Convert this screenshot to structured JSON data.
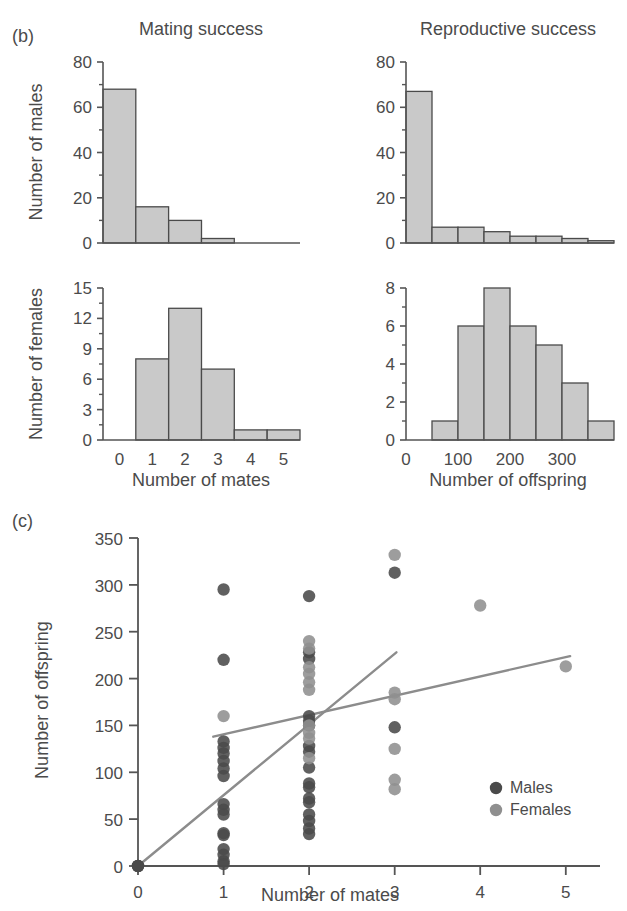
{
  "figure": {
    "panel_b_id": "(b)",
    "panel_c_id": "(c)",
    "top_clipped_text": "",
    "colors": {
      "bar_fill": "#c9c9c9",
      "bar_stroke": "#4a4a4a",
      "axis": "#555555",
      "male_dot": "#4a4a4a",
      "female_dot": "#8f8f8f",
      "regression_line": "#8c8c8c",
      "text": "#4b4b4b"
    }
  },
  "panel_b": {
    "titles": {
      "left": "Mating success",
      "right": "Reproductive success"
    },
    "axis_labels": {
      "males_y": "Number of males",
      "females_y": "Number of females",
      "mates_x": "Number of mates",
      "offspring_x": "Number of offspring"
    }
  },
  "panel_c": {
    "xlabel": "Number of mates",
    "ylabel": "Number of offspring",
    "legend": [
      {
        "label": "Males",
        "color": "#4a4a4a"
      },
      {
        "label": "Females",
        "color": "#8f8f8f"
      }
    ]
  },
  "chart_data": [
    {
      "type": "bar",
      "id": "males-mating-success",
      "title": "Mating success",
      "xlabel": "Number of mates",
      "ylabel": "Number of males",
      "categories": [
        "0",
        "1",
        "2",
        "3",
        "4",
        "5"
      ],
      "values": [
        68,
        16,
        10,
        2,
        0,
        0
      ],
      "xticks": [
        0,
        1,
        2,
        3,
        4,
        5
      ],
      "yticks": [
        0,
        20,
        40,
        60,
        80
      ],
      "ylim": [
        0,
        80
      ],
      "xlim": [
        0,
        6
      ],
      "grid": false,
      "legend": "none"
    },
    {
      "type": "bar",
      "id": "males-reproductive-success",
      "title": "Reproductive success",
      "xlabel": "Number of offspring",
      "ylabel": "Number of males",
      "bin_edges": [
        0,
        50,
        100,
        150,
        200,
        250,
        300,
        350,
        400
      ],
      "values": [
        67,
        7,
        7,
        5,
        3,
        3,
        2,
        1
      ],
      "xticks": [
        0,
        100,
        200,
        300
      ],
      "yticks": [
        0,
        20,
        40,
        60,
        80
      ],
      "ylim": [
        0,
        80
      ],
      "xlim": [
        0,
        400
      ],
      "grid": false,
      "legend": "none"
    },
    {
      "type": "bar",
      "id": "females-mating-success",
      "title": "Mating success",
      "xlabel": "Number of mates",
      "ylabel": "Number of females",
      "categories": [
        "0",
        "1",
        "2",
        "3",
        "4",
        "5"
      ],
      "values": [
        0,
        8,
        13,
        7,
        1,
        1
      ],
      "xticks": [
        0,
        1,
        2,
        3,
        4,
        5
      ],
      "yticks": [
        0,
        3,
        6,
        9,
        12,
        15
      ],
      "ylim": [
        0,
        15
      ],
      "xlim": [
        0,
        6
      ],
      "grid": false,
      "legend": "none"
    },
    {
      "type": "bar",
      "id": "females-reproductive-success",
      "title": "Reproductive success",
      "xlabel": "Number of offspring",
      "ylabel": "Number of females",
      "bin_edges": [
        0,
        50,
        100,
        150,
        200,
        250,
        300,
        350,
        400
      ],
      "values": [
        0,
        1,
        6,
        8,
        6,
        5,
        3,
        1
      ],
      "xticks": [
        0,
        100,
        200,
        300
      ],
      "yticks": [
        0,
        2,
        4,
        6,
        8
      ],
      "ylim": [
        0,
        8
      ],
      "xlim": [
        0,
        400
      ],
      "grid": false,
      "legend": "none"
    },
    {
      "type": "scatter",
      "id": "offspring-vs-mates",
      "title": "",
      "xlabel": "Number of mates",
      "ylabel": "Number of offspring",
      "xticks": [
        0,
        1,
        2,
        3,
        4,
        5
      ],
      "yticks": [
        0,
        50,
        100,
        150,
        200,
        250,
        300,
        350
      ],
      "xlim": [
        0,
        5.4
      ],
      "ylim": [
        0,
        350
      ],
      "grid": false,
      "legend_position": "bottom-right",
      "series": [
        {
          "name": "Males",
          "color": "#4a4a4a",
          "points": [
            [
              0,
              0
            ],
            [
              0,
              0
            ],
            [
              0,
              0
            ],
            [
              1,
              295
            ],
            [
              1,
              220
            ],
            [
              1,
              133
            ],
            [
              1,
              126
            ],
            [
              1,
              120
            ],
            [
              1,
              112
            ],
            [
              1,
              104
            ],
            [
              1,
              96
            ],
            [
              1,
              66
            ],
            [
              1,
              60
            ],
            [
              1,
              55
            ],
            [
              1,
              35
            ],
            [
              1,
              33
            ],
            [
              1,
              18
            ],
            [
              1,
              12
            ],
            [
              1,
              5
            ],
            [
              1,
              2
            ],
            [
              2,
              288
            ],
            [
              2,
              228
            ],
            [
              2,
              221
            ],
            [
              2,
              160
            ],
            [
              2,
              155
            ],
            [
              2,
              150
            ],
            [
              2,
              128
            ],
            [
              2,
              122
            ],
            [
              2,
              105
            ],
            [
              2,
              88
            ],
            [
              2,
              84
            ],
            [
              2,
              72
            ],
            [
              2,
              68
            ],
            [
              2,
              55
            ],
            [
              2,
              48
            ],
            [
              2,
              40
            ],
            [
              2,
              34
            ],
            [
              3,
              313
            ],
            [
              3,
              148
            ]
          ]
        },
        {
          "name": "Females",
          "color": "#8f8f8f",
          "points": [
            [
              1,
              160
            ],
            [
              2,
              240
            ],
            [
              2,
              232
            ],
            [
              2,
              212
            ],
            [
              2,
              205
            ],
            [
              2,
              196
            ],
            [
              2,
              188
            ],
            [
              2,
              150
            ],
            [
              2,
              142
            ],
            [
              2,
              136
            ],
            [
              2,
              115
            ],
            [
              3,
              332
            ],
            [
              3,
              185
            ],
            [
              3,
              178
            ],
            [
              3,
              125
            ],
            [
              3,
              92
            ],
            [
              3,
              82
            ],
            [
              4,
              278
            ],
            [
              5,
              213
            ]
          ]
        }
      ],
      "trendlines": [
        {
          "name": "Males",
          "color": "#8c8c8c",
          "x0": 0,
          "y0": 0,
          "x1": 3.02,
          "y1": 228
        },
        {
          "name": "Females",
          "color": "#8c8c8c",
          "x0": 0.88,
          "y0": 138,
          "x1": 5.05,
          "y1": 224
        }
      ]
    }
  ]
}
